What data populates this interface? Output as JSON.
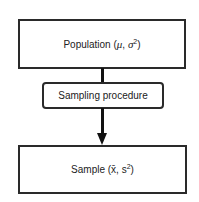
{
  "diagram": {
    "nodes": [
      {
        "id": "population",
        "label_prefix": "Population (",
        "sym1": "μ",
        "sep": ", ",
        "sym2": "σ",
        "exp": "2",
        "suffix": ")",
        "shape": "rectangle"
      },
      {
        "id": "sampling",
        "label": "Sampling procedure",
        "shape": "rounded-rectangle"
      },
      {
        "id": "sample",
        "label_prefix": "Sample (",
        "sym1": "x̄",
        "sep": ", ",
        "sym2": "s",
        "exp": "2",
        "suffix": ")",
        "shape": "rectangle"
      }
    ],
    "edges": [
      {
        "from": "population",
        "to": "sampling",
        "type": "line"
      },
      {
        "from": "sampling",
        "to": "sample",
        "type": "arrow"
      }
    ]
  }
}
